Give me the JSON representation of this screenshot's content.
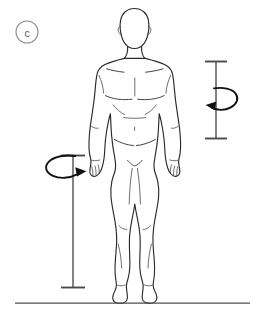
{
  "figure": {
    "panel_label": "c",
    "background_color": "#ffffff",
    "outline_color": "#2b2b2b",
    "detail_color": "#3a3a3a",
    "annotation_color": "#111111",
    "dimension_color": "#5a5a5a",
    "ground_color": "#4f4f4f",
    "label_color": "#55595c"
  },
  "annotations": {
    "panel_marker": {
      "name": "panel-label-c",
      "text": "c",
      "shape": "circle-outline",
      "center_x": 27,
      "center_y": 32,
      "radius": 11
    },
    "dimension_lines": [
      {
        "name": "right-vertical-dimension-line",
        "orientation": "vertical",
        "x": 216,
        "y_top": 61,
        "y_bottom": 139,
        "cap_half_width": 11,
        "cap_style": "flat-end-caps"
      },
      {
        "name": "left-vertical-dimension-line",
        "orientation": "vertical",
        "x": 73,
        "y_top": 155,
        "y_bottom": 288,
        "cap_half_width": 12,
        "cap_style": "flat-end-caps"
      }
    ],
    "rotation_arrows": [
      {
        "name": "right-rotation-arrow",
        "direction": "counterclockwise-pointing-left",
        "arrowhead_x": 207,
        "arrowhead_y": 105,
        "loop_side": "right"
      },
      {
        "name": "left-rotation-arrow",
        "direction": "clockwise-pointing-right",
        "arrowhead_x": 83,
        "arrowhead_y": 171,
        "loop_side": "left"
      }
    ],
    "ground_line": {
      "name": "ground-reference-line",
      "orientation": "horizontal",
      "y": 303,
      "x_start": 15,
      "x_end": 250
    }
  }
}
